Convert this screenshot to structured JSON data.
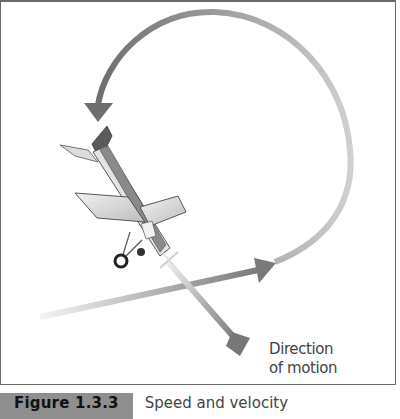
{
  "diagram": {
    "label_lines": [
      "Direction",
      "of motion"
    ],
    "caption": {
      "number": "Figure 1.3.3",
      "title": "Speed and velocity"
    },
    "colors": {
      "arrow_dark": "#6e6e6e",
      "arrow_light": "#c8c8c8",
      "caption_bg": "#8f8f8f",
      "border": "#6a6a6a"
    }
  }
}
